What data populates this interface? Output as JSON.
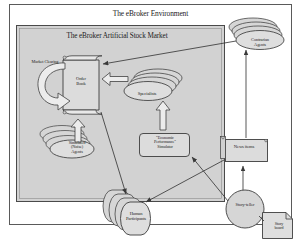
{
  "diagram": {
    "title": "The eBroker Environment",
    "inner_title": "The eBroker Artificial Stock Market",
    "colors": {
      "outer_frame_fill": "#ffffff",
      "outer_frame_stroke": "#555555",
      "inner_frame_fill": "#d2d2d2",
      "inner_frame_stroke": "#4a4a4a",
      "shape_fill": "#d8d8d8",
      "shape_stroke": "#3d3d3d",
      "arrow_fill": "#ededed",
      "arrow_stroke": "#4a4a4a",
      "line_stroke": "#3a3a3a",
      "text": "#1c1c1c"
    },
    "nodes": [
      {
        "id": "order-book",
        "label": "Order\nBook",
        "shape": "scroll"
      },
      {
        "id": "market-clearing",
        "label": "Market Clearing",
        "shape": "text-label"
      },
      {
        "id": "specialists",
        "label": "Specialists",
        "shape": "ellipse-stack"
      },
      {
        "id": "contrarian-agents",
        "label": "Contrarian\nAgents",
        "shape": "ellipse-stack"
      },
      {
        "id": "simulated-agents",
        "label": "Simulated\n(Noise)\nAgents",
        "shape": "ellipse-stack"
      },
      {
        "id": "econ-simulator",
        "label": "\"Economic\nPerformance\"\nSimulator",
        "shape": "rounded-box"
      },
      {
        "id": "news-items",
        "label": "News items",
        "shape": "flag-box"
      },
      {
        "id": "human-participants",
        "label": "Human\nParticipants",
        "shape": "cylinder-stack"
      },
      {
        "id": "story-teller",
        "label": "Story-teller",
        "shape": "circle"
      },
      {
        "id": "story-board",
        "label": "Story\nboard",
        "shape": "note"
      }
    ],
    "labels": {
      "order_book": [
        "Order",
        "Book"
      ],
      "market_clearing": "Market Clearing",
      "specialists": "Specialists",
      "contrarian_agents": [
        "Contrarian",
        "Agents"
      ],
      "simulated_agents": [
        "Simulated",
        "(Noise)",
        "Agents"
      ],
      "econ_simulator": [
        "\"Economic",
        "Performance\"",
        "Simulator"
      ],
      "news_items": "News items",
      "human_participants": [
        "Human",
        "Participants"
      ],
      "story_teller": "Story-teller",
      "story_board": [
        "Story",
        "board"
      ]
    },
    "edges": [
      {
        "from": "order-book",
        "to": "order-book",
        "kind": "curved-block-arrow",
        "note": "market clearing loop"
      },
      {
        "from": "specialists",
        "to": "order-book",
        "kind": "block-arrow-left"
      },
      {
        "from": "simulated-agents",
        "to": "order-book",
        "kind": "block-arrow-up"
      },
      {
        "from": "econ-simulator",
        "to": "specialists",
        "kind": "block-arrow-up"
      },
      {
        "from": "contrarian-agents",
        "to": "order-book",
        "kind": "line-arrow"
      },
      {
        "from": "news-items",
        "to": "contrarian-agents",
        "kind": "line-arrow"
      },
      {
        "from": "order-book",
        "to": "human-participants",
        "kind": "line-arrow"
      },
      {
        "from": "news-items",
        "to": "human-participants",
        "kind": "line-arrow"
      },
      {
        "from": "story-teller",
        "to": "news-items",
        "kind": "line-arrow"
      },
      {
        "from": "story-teller",
        "to": "econ-simulator",
        "kind": "line-arrow"
      },
      {
        "from": "story-board",
        "to": "story-teller",
        "kind": "line"
      }
    ]
  }
}
